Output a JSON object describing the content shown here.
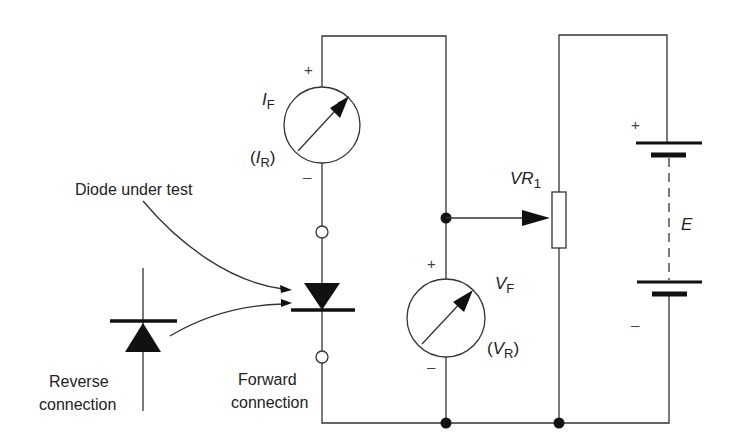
{
  "diagram": {
    "labels": {
      "diode_under_test": "Diode under test",
      "reverse_line1": "Reverse",
      "reverse_line2": "connection",
      "forward_line1": "Forward",
      "forward_line2": "connection",
      "ammeter_main_sym": "I",
      "ammeter_main_sub": "F",
      "ammeter_alt_open": "(",
      "ammeter_alt_sym": "I",
      "ammeter_alt_sub": "R",
      "ammeter_alt_close": ")",
      "voltmeter_main_sym": "V",
      "voltmeter_main_sub": "F",
      "voltmeter_alt_open": "(",
      "voltmeter_alt_sym": "V",
      "voltmeter_alt_sub": "R",
      "voltmeter_alt_close": ")",
      "pot_sym": "VR",
      "pot_sub": "1",
      "battery": "E",
      "plus": "+",
      "minus": "–"
    },
    "components": [
      {
        "id": "ammeter",
        "type": "meter",
        "reads": "I_F (I_R)"
      },
      {
        "id": "voltmeter",
        "type": "meter",
        "reads": "V_F (V_R)"
      },
      {
        "id": "diode-forward",
        "type": "diode",
        "orientation": "forward"
      },
      {
        "id": "diode-reverse",
        "type": "diode",
        "orientation": "reverse"
      },
      {
        "id": "potentiometer",
        "type": "variable-resistor",
        "label": "VR1"
      },
      {
        "id": "battery",
        "type": "battery",
        "label": "E"
      }
    ],
    "colors": {
      "line": "#333333",
      "fill": "#111111",
      "background": "#ffffff"
    }
  }
}
